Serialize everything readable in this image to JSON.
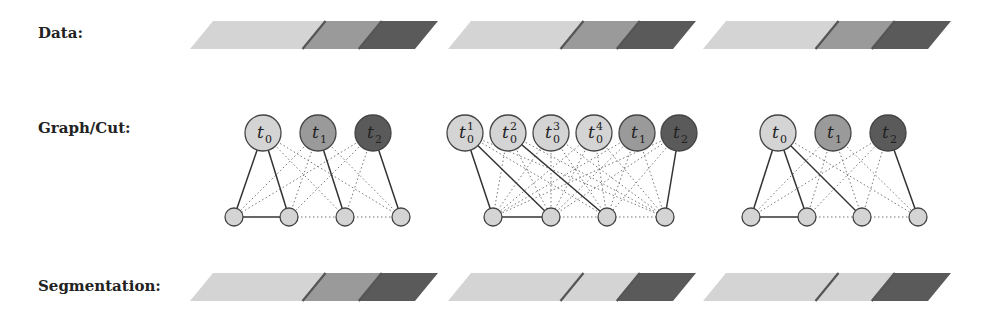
{
  "labels": {
    "data": "Data:",
    "graph": "Graph/Cut:",
    "segmentation": "Segmentation:"
  },
  "colors": {
    "light": "#d4d4d4",
    "mid": "#9a9a9a",
    "dark": "#5a5a5a",
    "divider": "#555555",
    "node_stroke": "#444444",
    "background": "#ffffff"
  },
  "data_bars": [
    {
      "segments": [
        "light",
        "mid",
        "dark"
      ]
    },
    {
      "segments": [
        "light",
        "mid",
        "dark"
      ]
    },
    {
      "segments": [
        "light",
        "mid",
        "dark"
      ]
    }
  ],
  "segmentation_bars": [
    {
      "segments": [
        "light",
        "mid",
        "dark"
      ]
    },
    {
      "segments": [
        "light",
        "light",
        "dark"
      ]
    },
    {
      "segments": [
        "light",
        "light",
        "dark"
      ]
    }
  ],
  "graphs": [
    {
      "top_nodes": [
        {
          "label": "t",
          "sub": "0",
          "sup": "",
          "color": "light"
        },
        {
          "label": "t",
          "sub": "1",
          "sup": "",
          "color": "mid"
        },
        {
          "label": "t",
          "sub": "2",
          "sup": "",
          "color": "dark"
        }
      ],
      "bottom_nodes": 4,
      "solid_edges": [
        [
          0,
          0
        ],
        [
          0,
          1
        ],
        [
          1,
          2
        ],
        [
          2,
          3
        ]
      ],
      "bottom_solid": [
        [
          0,
          1
        ]
      ]
    },
    {
      "top_nodes": [
        {
          "label": "t",
          "sub": "0",
          "sup": "1",
          "color": "light"
        },
        {
          "label": "t",
          "sub": "0",
          "sup": "2",
          "color": "light"
        },
        {
          "label": "t",
          "sub": "0",
          "sup": "3",
          "color": "light"
        },
        {
          "label": "t",
          "sub": "0",
          "sup": "4",
          "color": "light"
        },
        {
          "label": "t",
          "sub": "1",
          "sup": "",
          "color": "mid"
        },
        {
          "label": "t",
          "sub": "2",
          "sup": "",
          "color": "dark"
        }
      ],
      "bottom_nodes": 4,
      "solid_edges": [
        [
          0,
          0
        ],
        [
          0,
          1
        ],
        [
          1,
          2
        ],
        [
          5,
          3
        ]
      ],
      "bottom_solid": [
        [
          0,
          1
        ]
      ]
    },
    {
      "top_nodes": [
        {
          "label": "t",
          "sub": "0",
          "sup": "",
          "color": "light"
        },
        {
          "label": "t",
          "sub": "1",
          "sup": "",
          "color": "mid"
        },
        {
          "label": "t",
          "sub": "2",
          "sup": "",
          "color": "dark"
        }
      ],
      "bottom_nodes": 4,
      "solid_edges": [
        [
          0,
          0
        ],
        [
          0,
          1
        ],
        [
          0,
          2
        ],
        [
          2,
          3
        ]
      ],
      "bottom_solid": [
        [
          0,
          1
        ]
      ]
    }
  ]
}
